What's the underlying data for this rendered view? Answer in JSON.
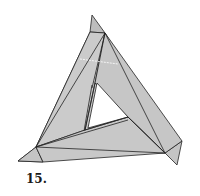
{
  "figure": {
    "label": "15.",
    "colors": {
      "fill": "#c8c8c8",
      "fill_dark": "#b8b8b8",
      "stroke": "#222222",
      "background": "#ffffff"
    }
  }
}
